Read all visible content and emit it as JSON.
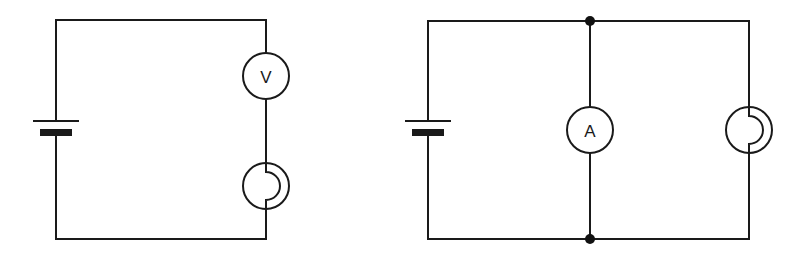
{
  "diagram": {
    "type": "circuit-schematics",
    "circuits": [
      {
        "id": "left",
        "description": "Series circuit: cell, voltmeter, lamp",
        "components": [
          {
            "type": "cell",
            "label": ""
          },
          {
            "type": "voltmeter",
            "label": "V"
          },
          {
            "type": "lamp",
            "label": ""
          }
        ]
      },
      {
        "id": "right",
        "description": "Cell with ammeter and lamp in parallel branches",
        "components": [
          {
            "type": "cell",
            "label": ""
          },
          {
            "type": "ammeter",
            "label": "A"
          },
          {
            "type": "lamp",
            "label": ""
          },
          {
            "type": "junction",
            "label": ""
          },
          {
            "type": "junction",
            "label": ""
          }
        ]
      }
    ],
    "colors": {
      "line": "#1a1a1a",
      "background": "#ffffff"
    }
  }
}
